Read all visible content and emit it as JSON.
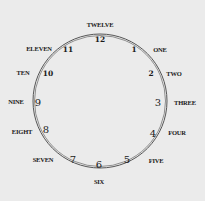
{
  "clock": {
    "center": [
      100,
      101
    ],
    "radius": 67,
    "ring_color": "#555555",
    "background": "#ebebeb",
    "hours": [
      {
        "num": "12",
        "word": "TWELVE",
        "num_pos": [
          100,
          40
        ],
        "word_pos": [
          100,
          25
        ],
        "small": true
      },
      {
        "num": "1",
        "word": "ONE",
        "num_pos": [
          134,
          50
        ],
        "word_pos": [
          160,
          50
        ],
        "small": true
      },
      {
        "num": "2",
        "word": "TWO",
        "num_pos": [
          151,
          74
        ],
        "word_pos": [
          174,
          74
        ],
        "small": true
      },
      {
        "num": "3",
        "word": "THREE",
        "num_pos": [
          158,
          103
        ],
        "word_pos": [
          185,
          103
        ],
        "small": false
      },
      {
        "num": "4",
        "word": "FOUR",
        "num_pos": [
          153,
          134
        ],
        "word_pos": [
          177,
          133
        ],
        "small": false
      },
      {
        "num": "5",
        "word": "FIVE",
        "num_pos": [
          127,
          160
        ],
        "word_pos": [
          156,
          161
        ],
        "small": false
      },
      {
        "num": "6",
        "word": "SIX",
        "num_pos": [
          99,
          165
        ],
        "word_pos": [
          99,
          182
        ],
        "small": false
      },
      {
        "num": "7",
        "word": "SEVEN",
        "num_pos": [
          73,
          160
        ],
        "word_pos": [
          43,
          160
        ],
        "small": false
      },
      {
        "num": "8",
        "word": "EIGHT",
        "num_pos": [
          46,
          130
        ],
        "word_pos": [
          22,
          132
        ],
        "small": false
      },
      {
        "num": "9",
        "word": "NINE",
        "num_pos": [
          38,
          103
        ],
        "word_pos": [
          16,
          102
        ],
        "small": false
      },
      {
        "num": "10",
        "word": "TEN",
        "num_pos": [
          48,
          74
        ],
        "word_pos": [
          23,
          73
        ],
        "small": true
      },
      {
        "num": "11",
        "word": "ELEVEN",
        "num_pos": [
          68,
          50
        ],
        "word_pos": [
          39,
          49
        ],
        "small": true
      }
    ]
  }
}
